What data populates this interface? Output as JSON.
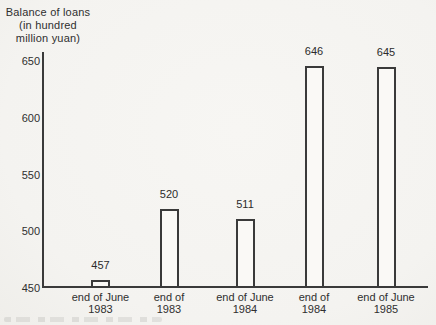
{
  "page": {
    "background": "#f5f4f1",
    "ink": "#3a3a3a"
  },
  "chart_data": {
    "type": "bar",
    "title": "Balance of loans (in hundred million yuan)",
    "title_lines": [
      "Balance of loans",
      "(in hundred",
      "million yuan)"
    ],
    "xlabel": "",
    "ylabel": "Balance of loans (in hundred million yuan)",
    "ylim": [
      450,
      650
    ],
    "yticks": [
      450,
      500,
      550,
      600,
      650
    ],
    "grid": false,
    "legend": "none",
    "categories": [
      "end of June 1983",
      "end of 1983",
      "end of June 1984",
      "end of 1984",
      "end of June 1985"
    ],
    "category_lines": [
      [
        "end of June",
        "1983"
      ],
      [
        "end of",
        "1983"
      ],
      [
        "end of June",
        "1984"
      ],
      [
        "end of",
        "1984"
      ],
      [
        "end of June",
        "1985"
      ]
    ],
    "values": [
      457,
      520,
      511,
      646,
      645
    ],
    "bar_fill": "#faf9f6",
    "bar_outline": "#3a3a3a"
  }
}
